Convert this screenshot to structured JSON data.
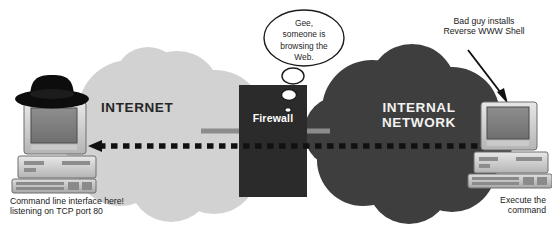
{
  "diagram": {
    "title_clouds": {
      "internet": "INTERNET",
      "internal_network": "INTERNAL\nNETWORK"
    },
    "firewall": {
      "label": "Firewall"
    },
    "thought_bubble": {
      "text": "Gee,\nsomeone is\nbrowsing the\nWeb."
    },
    "annotations": {
      "left_caption": "Command line interface here!\nlistening on TCP port 80",
      "right_caption": "Execute the\ncommand",
      "bad_guy": "Bad guy installs\nReverse WWW Shell"
    },
    "colors": {
      "internet_cloud": "#d2d2d2",
      "internal_cloud": "#3e3e3e",
      "firewall_box": "#2b2b2b",
      "dashed_arrow": "#111111",
      "solid_line": "#8c8c8c",
      "background": "#ffffff",
      "text_dark": "#1a1a1a",
      "text_light": "#f2f2f2"
    },
    "icons": {
      "left_computer": "desktop-computer-icon",
      "left_hat": "black-hat-icon",
      "right_computer": "desktop-computer-icon",
      "dashed_arrow": "arrow-left-dashed-icon",
      "bad_guy_arrow": "arrow-down-right-icon",
      "thought_bubble": "thought-bubble-icon"
    }
  }
}
